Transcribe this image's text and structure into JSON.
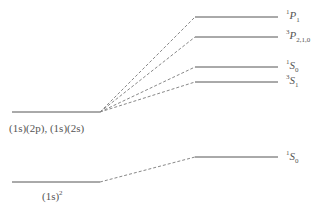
{
  "diagram": {
    "type": "energy-level-diagram",
    "left_levels": [
      {
        "id": "excited",
        "label": "(1s)(2p), (1s)(2s)",
        "y": 112
      },
      {
        "id": "ground",
        "label": "(1s)^2",
        "y": 182
      }
    ],
    "right_levels": [
      {
        "id": "1P1",
        "mult": "1",
        "L": "P",
        "J": "1",
        "y": 17,
        "from": "excited"
      },
      {
        "id": "3P210",
        "mult": "3",
        "L": "P",
        "J": "2,1,0",
        "y": 37,
        "from": "excited"
      },
      {
        "id": "1S0-excited",
        "mult": "1",
        "L": "S",
        "J": "0",
        "y": 67,
        "from": "excited"
      },
      {
        "id": "3S1",
        "mult": "3",
        "L": "S",
        "J": "1",
        "y": 82,
        "from": "excited"
      },
      {
        "id": "1S0-ground",
        "mult": "1",
        "L": "S",
        "J": "0",
        "y": 157,
        "from": "ground"
      }
    ],
    "colors": {
      "solid_line": "#555555",
      "dashed_line": "#888888",
      "text": "#555555"
    }
  },
  "labels": {
    "excited_config": "(1s)(2p), (1s)(2s)",
    "ground_config_base": "(1s)",
    "ground_config_exp": "2",
    "r1_mult": "1",
    "r1_L": "P",
    "r1_J": "1",
    "r2_mult": "3",
    "r2_L": "P",
    "r2_J": "2,1,0",
    "r3_mult": "1",
    "r3_L": "S",
    "r3_J": "0",
    "r4_mult": "3",
    "r4_L": "S",
    "r4_J": "1",
    "r5_mult": "1",
    "r5_L": "S",
    "r5_J": "0"
  }
}
